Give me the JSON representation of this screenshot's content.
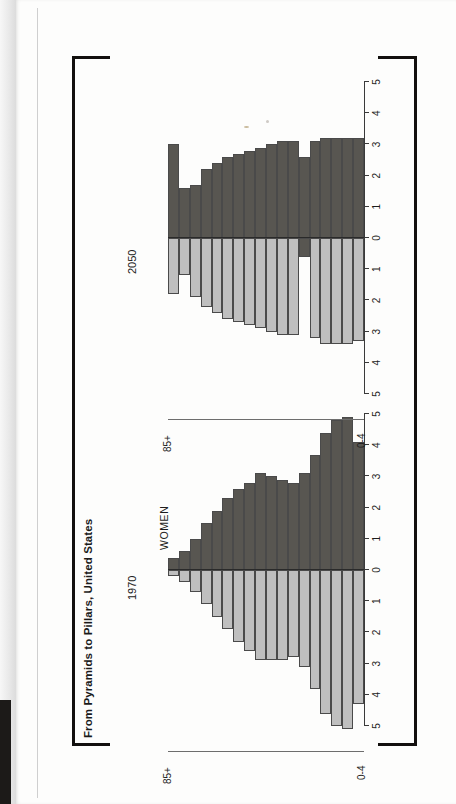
{
  "figure": {
    "title": "From Pyramids to Pillars, United States",
    "men_label": "MEN",
    "women_label": "WOMEN",
    "age_top_label": "85+",
    "age_bottom_label": "0-4",
    "men_color": "#bfbfbf",
    "women_color": "#585651",
    "axis_color": "#3a3a3a",
    "frame_color": "#12100e"
  },
  "panels": [
    {
      "year": "1970"
    },
    {
      "year": "2050"
    }
  ],
  "xaxis": {
    "ticks": [
      "5",
      "4",
      "3",
      "2",
      "1",
      "0",
      "1",
      "2",
      "3",
      "4",
      "5"
    ],
    "min": -5,
    "max": 5,
    "unit": "percent of total population"
  },
  "chart_data": [
    {
      "type": "bar",
      "title": "1970",
      "subtitle": "From Pyramids to Pillars, United States",
      "orientation": "horizontal-population-pyramid",
      "xlabel": "",
      "ylabel": "",
      "xlim": [
        -5,
        5
      ],
      "grid": false,
      "legend": [
        "MEN",
        "WOMEN"
      ],
      "legend_position": "in-plot",
      "categories": [
        "0-4",
        "5-9",
        "10-14",
        "15-19",
        "20-24",
        "25-29",
        "30-34",
        "35-39",
        "40-44",
        "45-49",
        "50-54",
        "55-59",
        "60-64",
        "65-69",
        "70-74",
        "75-79",
        "80-84",
        "85+"
      ],
      "series": [
        {
          "name": "MEN",
          "side": "left",
          "values": [
            4.3,
            5.1,
            5.0,
            4.6,
            3.8,
            3.1,
            2.8,
            2.9,
            2.9,
            2.9,
            2.6,
            2.3,
            1.9,
            1.5,
            1.1,
            0.7,
            0.4,
            0.2
          ]
        },
        {
          "name": "WOMEN",
          "side": "right",
          "values": [
            4.1,
            4.9,
            4.8,
            4.4,
            3.7,
            3.1,
            2.8,
            2.9,
            3.0,
            3.1,
            2.8,
            2.6,
            2.3,
            1.9,
            1.5,
            1.0,
            0.6,
            0.4
          ]
        }
      ]
    },
    {
      "type": "bar",
      "title": "2050",
      "subtitle": "From Pyramids to Pillars, United States",
      "orientation": "horizontal-population-pyramid",
      "xlabel": "",
      "ylabel": "",
      "xlim": [
        -5,
        5
      ],
      "grid": false,
      "legend": [
        "MEN",
        "WOMEN"
      ],
      "legend_position": "in-plot",
      "categories": [
        "0-4",
        "5-9",
        "10-14",
        "15-19",
        "20-24",
        "25-29",
        "30-34",
        "35-39",
        "40-44",
        "45-49",
        "50-54",
        "55-59",
        "60-64",
        "65-69",
        "70-74",
        "75-79",
        "80-84",
        "85+"
      ],
      "series": [
        {
          "name": "MEN",
          "side": "left",
          "values": [
            3.3,
            3.4,
            3.4,
            3.4,
            3.2,
            0.6,
            3.1,
            3.1,
            3.0,
            2.9,
            2.8,
            2.7,
            2.6,
            2.4,
            2.2,
            1.9,
            1.2,
            1.8
          ]
        },
        {
          "name": "WOMEN",
          "side": "right",
          "values": [
            3.2,
            3.2,
            3.2,
            3.2,
            3.1,
            2.6,
            3.1,
            3.1,
            3.0,
            2.9,
            2.8,
            2.7,
            2.6,
            2.4,
            2.2,
            1.7,
            1.6,
            3.0
          ]
        }
      ]
    }
  ]
}
